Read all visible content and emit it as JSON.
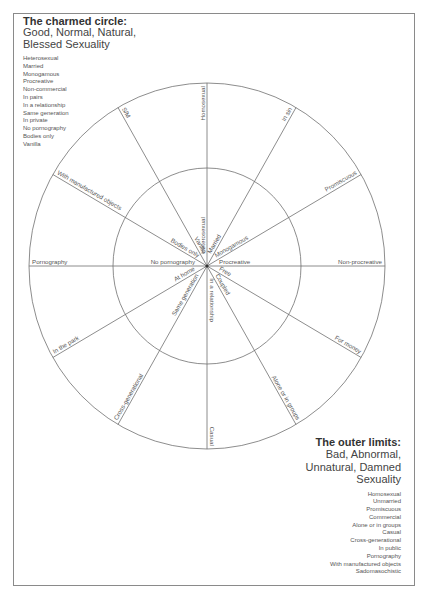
{
  "charmed": {
    "title": "The charmed circle:",
    "subtitle_line1": "Good, Normal, Natural,",
    "subtitle_line2": "Blessed Sexuality",
    "items": [
      "Heterosexual",
      "Married",
      "Monogamous",
      "Procreative",
      "Non-commercial",
      "In pairs",
      "In a relationship",
      "Same generation",
      "In private",
      "No pornography",
      "Bodies only",
      "Vanilla"
    ]
  },
  "outer": {
    "title": "The outer limits:",
    "subtitle_line1": "Bad, Abnormal,",
    "subtitle_line2": "Unnatural, Damned",
    "subtitle_line3": "Sexuality",
    "items": [
      "Homosexual",
      "Unmarried",
      "Promiscuous",
      "Commercial",
      "Alone or in groups",
      "Casual",
      "Cross-generational",
      "In public",
      "Pornography",
      "With manufactured objects",
      "Sadomasochistic"
    ]
  },
  "wheel": {
    "center": [
      207,
      266
    ],
    "outer_radius": [
      178,
      183
    ],
    "inner_radius": [
      94,
      98
    ],
    "line_color": "#707070",
    "spokes": [
      {
        "angle": 0,
        "inner": "Procreative",
        "outer": "Non-procreative"
      },
      {
        "angle": 30,
        "inner": "Monogamous",
        "outer": "Promiscuous"
      },
      {
        "angle": 60,
        "inner": "Married",
        "outer": "In sin"
      },
      {
        "angle": 90,
        "inner": "Heterosexual",
        "outer": "Homosexual"
      },
      {
        "angle": 120,
        "inner": "Vanilla",
        "outer": "S/M"
      },
      {
        "angle": 150,
        "inner": "Bodies only",
        "outer": "With manufactured objects"
      },
      {
        "angle": 180,
        "inner": "No pornography",
        "outer": "Pornography"
      },
      {
        "angle": 210,
        "inner": "At home",
        "outer": "In the park"
      },
      {
        "angle": 240,
        "inner": "Same generation",
        "outer": "Cross-generational"
      },
      {
        "angle": 270,
        "inner": "In a relationship",
        "outer": "Casual"
      },
      {
        "angle": 300,
        "inner": "Coupled",
        "outer": "Alone or in groups"
      },
      {
        "angle": 330,
        "inner": "Free",
        "outer": "For money"
      }
    ]
  }
}
